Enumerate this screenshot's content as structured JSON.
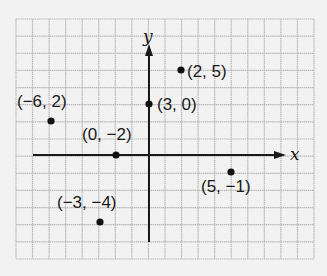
{
  "figure": {
    "type": "coordinate-plane",
    "background": "#f2f2f2",
    "grid_color": "#b8b8b8",
    "axis_color": "#1a1a1a",
    "point_color": "#111111",
    "grid": {
      "left": 16,
      "top": 19,
      "right": 314,
      "bottom": 259,
      "cols": 18,
      "rows": 14
    },
    "axes": {
      "x_label": "x",
      "y_label": "y",
      "origin_px": [
        149,
        155
      ],
      "x_axis_px": {
        "start": 33,
        "end": 286
      },
      "y_axis_px": {
        "start": 242,
        "end": 44
      }
    },
    "points": [
      {
        "label": "(2, 5)",
        "px": [
          181,
          70
        ],
        "label_px": [
          187,
          77
        ],
        "anchor": "start"
      },
      {
        "label": "(3, 0)",
        "px": [
          149,
          104
        ],
        "label_px": [
          157,
          110
        ],
        "anchor": "start"
      },
      {
        "label": "(−6, 2)",
        "px": [
          51,
          121
        ],
        "label_px": [
          17,
          107
        ],
        "anchor": "start"
      },
      {
        "label": "(0, −2)",
        "px": [
          116,
          155
        ],
        "label_px": [
          82,
          140
        ],
        "anchor": "start"
      },
      {
        "label": "(5, −1)",
        "px": [
          231,
          172
        ],
        "label_px": [
          201,
          192
        ],
        "anchor": "start"
      },
      {
        "label": "(−3, −4)",
        "px": [
          100,
          222
        ],
        "label_px": [
          57,
          208
        ],
        "anchor": "start"
      }
    ]
  }
}
